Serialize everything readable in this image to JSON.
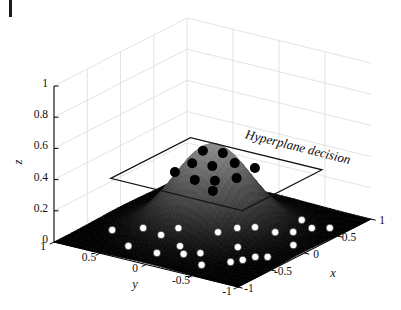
{
  "figure": {
    "background": "#ffffff",
    "corner_mark_color": "#1c1c1c"
  },
  "chart_data": {
    "type": "surface3d_scatter",
    "title": "",
    "annotation": {
      "text": "Hyperplane decision",
      "angle_deg": 14
    },
    "axes": {
      "x": {
        "label": "x",
        "range": [
          -1,
          1
        ],
        "ticks": [
          1,
          0.5,
          0,
          -0.5,
          -1
        ],
        "tick_labels": [
          "1",
          "0.5",
          "0",
          "-0.5",
          "-1"
        ]
      },
      "y": {
        "label": "y",
        "range": [
          -1,
          1
        ],
        "ticks": [
          1,
          0.5,
          0,
          -0.5,
          -1
        ],
        "tick_labels": [
          "1",
          "0.5",
          "0",
          "-0.5",
          "-1"
        ]
      },
      "z": {
        "label": "z",
        "range": [
          0,
          1
        ],
        "ticks": [
          0,
          0.2,
          0.4,
          0.6,
          0.8,
          1
        ],
        "tick_labels": [
          "0",
          "0.2",
          "0.4",
          "0.6",
          "0.8",
          "1"
        ]
      }
    },
    "grid": {
      "on": true,
      "color": "#dcdcdc"
    },
    "surface": {
      "model": "gaussian_bump",
      "amplitude": 0.55,
      "sigma": 0.35,
      "domain_x": [
        -1,
        1
      ],
      "domain_y": [
        -1,
        1
      ],
      "colormap": "gray",
      "color_scale": [
        0,
        1
      ],
      "shading": "interp"
    },
    "hyperplane": {
      "z": 0.4,
      "x_range": [
        -0.7,
        0.5
      ],
      "y_range": [
        -0.83,
        0.6
      ],
      "edge_color": "#141414"
    },
    "series": [
      {
        "name": "inside-class-points",
        "marker": {
          "shape": "circle",
          "fill": "#000000",
          "radius": 5
        },
        "z": 0.48,
        "points": [
          [
            0.05,
            0.14
          ],
          [
            0.1,
            -0.04
          ],
          [
            -0.25,
            0.04
          ],
          [
            -0.21,
            -0.15
          ],
          [
            -0.04,
            -0.27
          ],
          [
            -0.04,
            -0.49
          ],
          [
            -0.51,
            0.04
          ],
          [
            -0.57,
            -0.22
          ],
          [
            -0.49,
            -0.38
          ],
          [
            -0.33,
            -0.5
          ],
          [
            -0.7,
            -0.51
          ]
        ]
      },
      {
        "name": "outside-class-points",
        "marker": {
          "shape": "circle",
          "fill": "#ffffff",
          "stroke": "#1a1a1a",
          "radius": 3.7
        },
        "z": 0.02,
        "points": [
          [
            -0.54,
            0.7
          ],
          [
            -0.35,
            0.5
          ],
          [
            -0.4,
            0.27
          ],
          [
            -0.18,
            0.24
          ],
          [
            -0.78,
            0.35
          ],
          [
            -0.78,
            0.04
          ],
          [
            -0.53,
            -0.03
          ],
          [
            -0.67,
            -0.17
          ],
          [
            -0.57,
            -0.28
          ],
          [
            -0.07,
            -0.11
          ],
          [
            -0.8,
            -0.46
          ],
          [
            -0.6,
            -0.63
          ],
          [
            0.11,
            -0.19
          ],
          [
            0.21,
            -0.31
          ],
          [
            -0.27,
            -0.47
          ],
          [
            -0.5,
            -0.69
          ],
          [
            -0.38,
            -0.74
          ],
          [
            -0.32,
            -0.83
          ],
          [
            0.21,
            -0.53
          ],
          [
            0.3,
            -0.66
          ],
          [
            0.58,
            -0.55
          ],
          [
            0.47,
            -0.74
          ],
          [
            0.56,
            -0.87
          ],
          [
            0.04,
            -0.85
          ]
        ]
      }
    ]
  }
}
